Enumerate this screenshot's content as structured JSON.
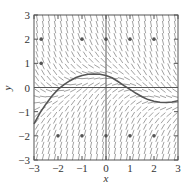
{
  "chart_data": {
    "type": "slope-field",
    "title": "",
    "xlabel": "x",
    "ylabel": "y",
    "xlim": [
      -3,
      3
    ],
    "ylim": [
      -3,
      3
    ],
    "x_ticks": [
      "-3",
      "-2",
      "-1",
      "0",
      "1",
      "2",
      "3"
    ],
    "y_ticks": [
      "-3",
      "-2",
      "-1",
      "0",
      "1",
      "2",
      "3"
    ],
    "grid": true,
    "grid_lines_at": [
      -3,
      0,
      3
    ],
    "slope_field": {
      "x_step": 0.25,
      "y_step": 0.25,
      "description": "Slopes steeply negative for large y, horizontal near an equilibrium curve, and steeply positive for negative y"
    },
    "solution_curve": {
      "points": [
        [
          -3.0,
          -1.5
        ],
        [
          -2.75,
          -1.05
        ],
        [
          -2.5,
          -0.68
        ],
        [
          -2.25,
          -0.35
        ],
        [
          -2.0,
          -0.08
        ],
        [
          -1.75,
          0.12
        ],
        [
          -1.5,
          0.28
        ],
        [
          -1.25,
          0.41
        ],
        [
          -1.0,
          0.5
        ],
        [
          -0.75,
          0.55
        ],
        [
          -0.5,
          0.56
        ],
        [
          -0.25,
          0.55
        ],
        [
          0.0,
          0.5
        ],
        [
          0.25,
          0.4
        ],
        [
          0.5,
          0.25
        ],
        [
          0.75,
          0.08
        ],
        [
          1.0,
          -0.08
        ],
        [
          1.25,
          -0.24
        ],
        [
          1.5,
          -0.38
        ],
        [
          1.75,
          -0.5
        ],
        [
          2.0,
          -0.57
        ],
        [
          2.25,
          -0.61
        ],
        [
          2.5,
          -0.62
        ],
        [
          2.75,
          -0.6
        ],
        [
          3.0,
          -0.55
        ]
      ],
      "color": "#555555"
    },
    "marked_points": [
      [
        -2.7,
        2
      ],
      [
        -1,
        2
      ],
      [
        0,
        2
      ],
      [
        1,
        2
      ],
      [
        2,
        2
      ],
      [
        -2.7,
        1
      ],
      [
        -2,
        -2
      ],
      [
        -1,
        -2
      ],
      [
        0,
        -2
      ],
      [
        1,
        -2
      ],
      [
        2,
        -2
      ]
    ],
    "colors": {
      "axes": "#555555",
      "segments": "#8a8a8a",
      "points": "#555555",
      "text": "#333333"
    }
  }
}
